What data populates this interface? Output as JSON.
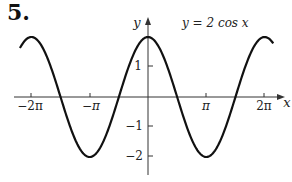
{
  "problem_number": "5.",
  "chart_data": {
    "type": "line",
    "title": "y = 2 cos x",
    "equation_label": "y = 2 cos x",
    "xlabel": "x",
    "ylabel": "y",
    "x_ticks": [
      "−2π",
      "−π",
      "π",
      "2π"
    ],
    "x_tick_values": [
      -6.2832,
      -3.1416,
      3.1416,
      6.2832
    ],
    "y_ticks": [
      "1",
      "−1",
      "−2"
    ],
    "y_tick_values": [
      1,
      -1,
      -2
    ],
    "xlim": [
      -6.9,
      6.75
    ],
    "ylim": [
      -2.6,
      2.6
    ],
    "grid": false,
    "series": [
      {
        "name": "2cos(x)",
        "function": "2*cos(x)",
        "x": [
          -6.9,
          -6.2832,
          -4.7124,
          -3.1416,
          -1.5708,
          0,
          1.5708,
          3.1416,
          4.7124,
          6.2832,
          6.75
        ],
        "values": [
          1.63,
          2,
          0,
          -2,
          0,
          2,
          0,
          -2,
          0,
          2,
          1.79
        ]
      }
    ]
  }
}
